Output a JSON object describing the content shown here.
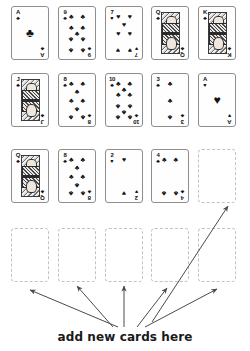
{
  "document": {
    "title": "add new cards here",
    "caption": "add new cards here",
    "background_color": "#ffffff",
    "ink_color": "#111111",
    "placeholder_border_color": "#c2c2c2",
    "card_border_color": "#8e8e8e"
  },
  "suit_glyphs": {
    "clubs": "♣",
    "hearts": "♥",
    "spades": "♠",
    "diamonds": "♦"
  },
  "card_grid": {
    "columns": 5,
    "rows": 4,
    "card_width_px": 38,
    "card_height_px": 54,
    "rows_data": [
      {
        "index": 0,
        "cards": [
          {
            "rank": "A",
            "suit": "clubs",
            "type": "ace",
            "pip_count": 1,
            "label": "Ace of Clubs"
          },
          {
            "rank": "9",
            "suit": "clubs",
            "type": "spot",
            "pip_count": 9,
            "label": "Nine of Clubs"
          },
          {
            "rank": "7",
            "suit": "hearts",
            "type": "spot",
            "pip_count": 7,
            "label": "Seven of Hearts"
          },
          {
            "rank": "Q",
            "suit": "clubs",
            "type": "court",
            "pip_count": 0,
            "label": "Queen of Clubs"
          },
          {
            "rank": "K",
            "suit": "clubs",
            "type": "court",
            "pip_count": 0,
            "label": "King of Clubs"
          }
        ]
      },
      {
        "index": 1,
        "cards": [
          {
            "rank": "J",
            "suit": "clubs",
            "type": "court",
            "pip_count": 0,
            "label": "Jack of Clubs"
          },
          {
            "rank": "8",
            "suit": "clubs",
            "type": "spot",
            "pip_count": 8,
            "label": "Eight of Clubs"
          },
          {
            "rank": "10",
            "suit": "clubs",
            "type": "spot",
            "pip_count": 10,
            "label": "Ten of Clubs"
          },
          {
            "rank": "3",
            "suit": "clubs",
            "type": "spot",
            "pip_count": 3,
            "label": "Three of Clubs"
          },
          {
            "rank": "A",
            "suit": "hearts",
            "type": "ace",
            "pip_count": 1,
            "label": "Ace of Hearts"
          }
        ]
      },
      {
        "index": 2,
        "cards": [
          {
            "rank": "Q",
            "suit": "clubs",
            "type": "court",
            "pip_count": 0,
            "label": "Queen of Clubs"
          },
          {
            "rank": "8",
            "suit": "clubs",
            "type": "spot",
            "pip_count": 8,
            "label": "Eight of Clubs"
          },
          {
            "rank": "2",
            "suit": "hearts",
            "type": "spot",
            "pip_count": 2,
            "label": "Two of Hearts"
          },
          {
            "rank": "4",
            "suit": "clubs",
            "type": "spot",
            "pip_count": 4,
            "label": "Four of Clubs"
          },
          {
            "rank": "",
            "suit": "",
            "type": "empty",
            "pip_count": 0,
            "label": "Empty card slot"
          }
        ]
      },
      {
        "index": 3,
        "cards": [
          {
            "rank": "",
            "suit": "",
            "type": "empty",
            "pip_count": 0,
            "label": "Empty card slot"
          },
          {
            "rank": "",
            "suit": "",
            "type": "empty",
            "pip_count": 0,
            "label": "Empty card slot"
          },
          {
            "rank": "",
            "suit": "",
            "type": "empty",
            "pip_count": 0,
            "label": "Empty card slot"
          },
          {
            "rank": "",
            "suit": "",
            "type": "empty",
            "pip_count": 0,
            "label": "Empty card slot"
          },
          {
            "rank": "",
            "suit": "",
            "type": "empty",
            "pip_count": 0,
            "label": "Empty card slot"
          }
        ]
      }
    ]
  },
  "annotations": {
    "arrow_color": "#4a4a4a",
    "arrow_count": 6,
    "arrows": [
      {
        "id": "arrow-to-slot-r3c0",
        "x1": 118,
        "y1": 327,
        "x2": 30,
        "y2": 290
      },
      {
        "id": "arrow-to-slot-r3c1",
        "x1": 113,
        "y1": 327,
        "x2": 77,
        "y2": 286
      },
      {
        "id": "arrow-to-slot-r3c2",
        "x1": 124,
        "y1": 327,
        "x2": 124,
        "y2": 286
      },
      {
        "id": "arrow-to-slot-r3c3",
        "x1": 137,
        "y1": 327,
        "x2": 167,
        "y2": 288
      },
      {
        "id": "arrow-to-slot-r3c4",
        "x1": 145,
        "y1": 327,
        "x2": 217,
        "y2": 289
      },
      {
        "id": "arrow-to-slot-r2c4",
        "x1": 152,
        "y1": 322,
        "x2": 228,
        "y2": 206
      }
    ]
  },
  "pip_layouts": {
    "1": [
      [
        50,
        50
      ]
    ],
    "2": [
      [
        50,
        12
      ],
      [
        50,
        88
      ]
    ],
    "3": [
      [
        50,
        12
      ],
      [
        50,
        50
      ],
      [
        50,
        88
      ]
    ],
    "4": [
      [
        18,
        12
      ],
      [
        82,
        12
      ],
      [
        18,
        88
      ],
      [
        82,
        88
      ]
    ],
    "6": [
      [
        18,
        12
      ],
      [
        82,
        12
      ],
      [
        18,
        50
      ],
      [
        82,
        50
      ],
      [
        18,
        88
      ],
      [
        82,
        88
      ]
    ],
    "7": [
      [
        18,
        12
      ],
      [
        82,
        12
      ],
      [
        50,
        31
      ],
      [
        18,
        50
      ],
      [
        82,
        50
      ],
      [
        18,
        88
      ],
      [
        82,
        88
      ]
    ],
    "8": [
      [
        18,
        12
      ],
      [
        82,
        12
      ],
      [
        50,
        31
      ],
      [
        18,
        50
      ],
      [
        82,
        50
      ],
      [
        50,
        69
      ],
      [
        18,
        88
      ],
      [
        82,
        88
      ]
    ],
    "9": [
      [
        18,
        12
      ],
      [
        82,
        12
      ],
      [
        18,
        38
      ],
      [
        82,
        38
      ],
      [
        50,
        50
      ],
      [
        18,
        63
      ],
      [
        82,
        63
      ],
      [
        18,
        88
      ],
      [
        82,
        88
      ]
    ],
    "10": [
      [
        18,
        12
      ],
      [
        82,
        12
      ],
      [
        50,
        25
      ],
      [
        18,
        38
      ],
      [
        82,
        38
      ],
      [
        18,
        63
      ],
      [
        82,
        63
      ],
      [
        50,
        75
      ],
      [
        18,
        88
      ],
      [
        82,
        88
      ]
    ]
  }
}
